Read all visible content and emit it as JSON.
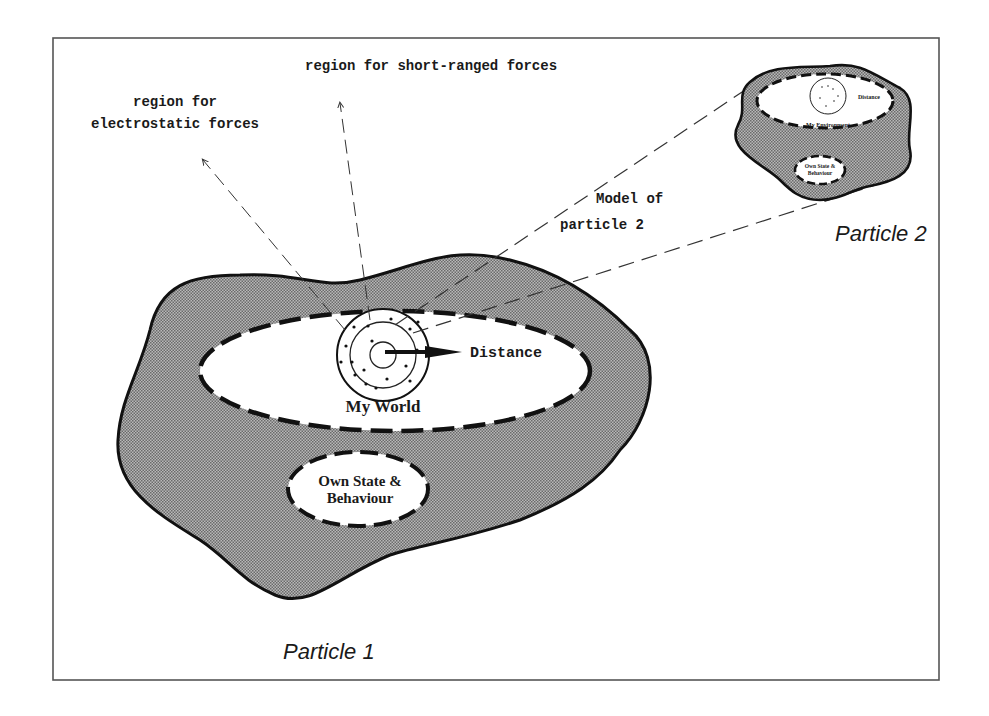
{
  "diagram": {
    "labels": {
      "short_ranged": "region for short-ranged forces",
      "electrostatic_line1": "region for",
      "electrostatic_line2": "electrostatic forces",
      "model_line1": "Model of",
      "model_line2": "particle 2",
      "distance": "Distance",
      "my_world": "My World",
      "own_state_line1": "Own State &",
      "own_state_line2": "Behaviour",
      "particle1": "Particle 1",
      "particle2": "Particle 2",
      "p2_distance": "Distance",
      "p2_env": "My Environment",
      "p2_own_line1": "Own State &",
      "p2_own_line2": "Behaviour"
    },
    "colors": {
      "blob_fill": "#9a9a9a",
      "outline": "#111111",
      "frame": "#555555",
      "background": "#ffffff"
    }
  }
}
